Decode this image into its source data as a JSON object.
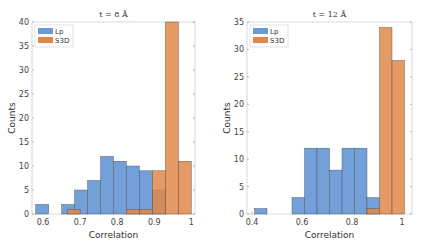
{
  "chart_data": [
    {
      "type": "bar",
      "title": "t = 8 Å",
      "xlabel": "Correlation",
      "ylabel": "Counts",
      "xlim": [
        0.57,
        1.01
      ],
      "ylim": [
        0,
        40
      ],
      "xticks": [
        0.6,
        0.7,
        0.8,
        0.9,
        1
      ],
      "xtick_labels": [
        "0.6",
        "0.7",
        "0.8",
        "0.9",
        "1"
      ],
      "yticks": [
        0,
        5,
        10,
        15,
        20,
        25,
        30,
        35,
        40
      ],
      "legend": [
        "Lp",
        "S3D"
      ],
      "legend_position": "upper left",
      "series": [
        {
          "name": "Lp",
          "color": "#6b9bd6",
          "bins": [
            [
              0.58,
              0.615,
              2
            ],
            [
              0.65,
              0.685,
              2
            ],
            [
              0.685,
              0.72,
              5
            ],
            [
              0.72,
              0.755,
              7
            ],
            [
              0.755,
              0.79,
              12
            ],
            [
              0.79,
              0.825,
              11
            ],
            [
              0.825,
              0.86,
              10
            ],
            [
              0.86,
              0.895,
              9
            ],
            [
              0.895,
              0.93,
              5
            ]
          ]
        },
        {
          "name": "S3D",
          "color": "#e0874a",
          "bins": [
            [
              0.665,
              0.7,
              1
            ],
            [
              0.825,
              0.86,
              1
            ],
            [
              0.86,
              0.895,
              1
            ],
            [
              0.895,
              0.93,
              9
            ],
            [
              0.93,
              0.965,
              40
            ],
            [
              0.965,
              1.0,
              11
            ]
          ]
        }
      ]
    },
    {
      "type": "bar",
      "title": "t = 12 Å",
      "xlabel": "Correlation",
      "ylabel": "Counts",
      "xlim": [
        0.38,
        1.04
      ],
      "ylim": [
        0,
        35
      ],
      "xticks": [
        0.4,
        0.6,
        0.8,
        1
      ],
      "xtick_labels": [
        "0.4",
        "0.6",
        "0.8",
        "1"
      ],
      "yticks": [
        0,
        5,
        10,
        15,
        20,
        25,
        30,
        35
      ],
      "legend": [
        "Lp",
        "S3D"
      ],
      "legend_position": "upper left",
      "series": [
        {
          "name": "Lp",
          "color": "#6b9bd6",
          "bins": [
            [
              0.41,
              0.46,
              1
            ],
            [
              0.56,
              0.61,
              3
            ],
            [
              0.61,
              0.66,
              12
            ],
            [
              0.66,
              0.71,
              12
            ],
            [
              0.71,
              0.76,
              8
            ],
            [
              0.76,
              0.81,
              12
            ],
            [
              0.81,
              0.86,
              12
            ],
            [
              0.86,
              0.91,
              3
            ]
          ]
        },
        {
          "name": "S3D",
          "color": "#e0874a",
          "bins": [
            [
              0.86,
              0.91,
              1
            ],
            [
              0.91,
              0.96,
              34
            ],
            [
              0.96,
              1.01,
              28
            ]
          ]
        }
      ]
    }
  ],
  "plots": [
    {
      "title": "t = 8 Å",
      "xlabel": "Correlation",
      "ylabel": "Counts",
      "legend": [
        "Lp",
        "S3D"
      ]
    },
    {
      "title": "t = 12 Å",
      "xlabel": "Correlation",
      "ylabel": "Counts",
      "legend": [
        "Lp",
        "S3D"
      ]
    }
  ]
}
